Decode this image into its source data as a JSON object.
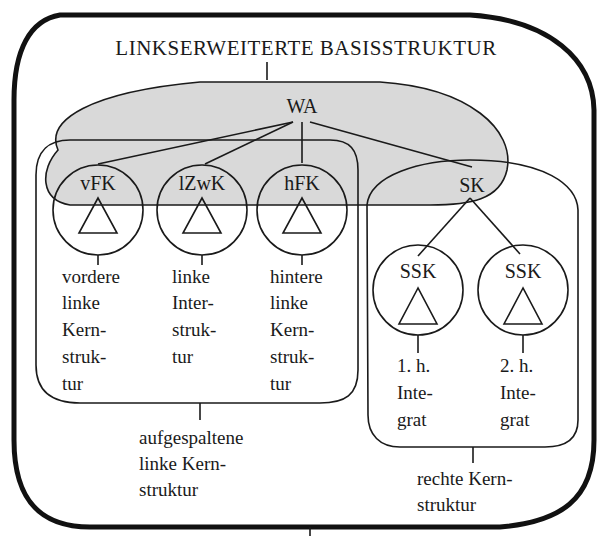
{
  "title": "LINKSERWEITERTE BASISSTRUKTUR",
  "colors": {
    "shade": "#d9d9d9",
    "ink": "#1a1a1a"
  },
  "root": {
    "label": "WA"
  },
  "left_nodes": [
    {
      "label": "vFK",
      "desc": [
        "vordere",
        "linke",
        "Kern-",
        "struk-",
        "tur"
      ]
    },
    {
      "label": "lZwK",
      "desc": [
        "linke",
        "Inter-",
        "struk-",
        "tur"
      ]
    },
    {
      "label": "hFK",
      "desc": [
        "hintere",
        "linke",
        "Kern-",
        "struk-",
        "tur"
      ]
    }
  ],
  "right_root": {
    "label": "SK"
  },
  "right_nodes": [
    {
      "label": "SSK",
      "desc": [
        "1. h.",
        "Inte-",
        "grat"
      ]
    },
    {
      "label": "SSK",
      "desc": [
        "2. h.",
        "Inte-",
        "grat"
      ]
    }
  ],
  "left_group_label": [
    "aufgespaltene",
    "linke Kern-",
    "struktur"
  ],
  "right_group_label": [
    "rechte Kern-",
    "struktur"
  ]
}
